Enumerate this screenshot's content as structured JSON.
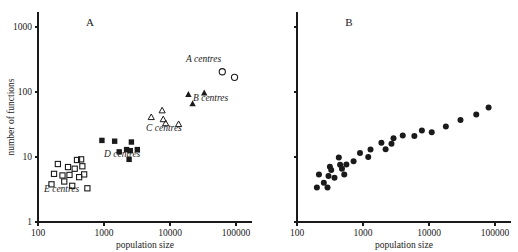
{
  "figure": {
    "background": "#ffffff",
    "ink": "#1a1a1a"
  },
  "chart_data": [
    {
      "type": "scatter",
      "panel": "A",
      "title": "A",
      "xlabel": "population size",
      "ylabel": "number of functions",
      "xscale": "log",
      "yscale": "log",
      "xlim": [
        100,
        316228
      ],
      "ylim": [
        1,
        3162
      ],
      "xticks": [
        100,
        1000,
        10000,
        100000
      ],
      "xticklabels": [
        "100",
        "1000",
        "10000",
        "100000"
      ],
      "yticks": [
        1,
        10,
        100,
        1000
      ],
      "yticklabels": [
        "1",
        "10",
        "100",
        "1000"
      ],
      "grid": false,
      "legend_position": "inline-annotations",
      "series": [
        {
          "name": "A centres",
          "marker": "open-circle",
          "label": "A centres",
          "points": [
            {
              "x": 62000,
              "y": 205
            },
            {
              "x": 95000,
              "y": 168
            }
          ]
        },
        {
          "name": "B centres",
          "marker": "filled-triangle",
          "label": "B centres",
          "points": [
            {
              "x": 19000,
              "y": 92
            },
            {
              "x": 22000,
              "y": 66
            },
            {
              "x": 33000,
              "y": 97
            }
          ]
        },
        {
          "name": "C centres",
          "marker": "open-triangle",
          "label": "C centres",
          "points": [
            {
              "x": 5200,
              "y": 41
            },
            {
              "x": 7600,
              "y": 52
            },
            {
              "x": 7900,
              "y": 38
            },
            {
              "x": 8600,
              "y": 33
            },
            {
              "x": 13500,
              "y": 32
            }
          ]
        },
        {
          "name": "D centres",
          "marker": "filled-square",
          "label": "D centres",
          "points": [
            {
              "x": 930,
              "y": 18
            },
            {
              "x": 1450,
              "y": 17.5
            },
            {
              "x": 1700,
              "y": 12
            },
            {
              "x": 2200,
              "y": 13
            },
            {
              "x": 2400,
              "y": 9.2
            },
            {
              "x": 2600,
              "y": 17
            },
            {
              "x": 3200,
              "y": 13
            },
            {
              "x": 2500,
              "y": 12.5
            }
          ]
        },
        {
          "name": "E centres",
          "marker": "open-square",
          "label": "E centres",
          "points": [
            {
              "x": 160,
              "y": 3.8
            },
            {
              "x": 175,
              "y": 5.5
            },
            {
              "x": 200,
              "y": 7.8
            },
            {
              "x": 235,
              "y": 5.2
            },
            {
              "x": 250,
              "y": 4.2
            },
            {
              "x": 285,
              "y": 7.0
            },
            {
              "x": 300,
              "y": 5.3
            },
            {
              "x": 330,
              "y": 3.6
            },
            {
              "x": 360,
              "y": 6.6
            },
            {
              "x": 390,
              "y": 9.0
            },
            {
              "x": 420,
              "y": 4.9
            },
            {
              "x": 450,
              "y": 9.2
            },
            {
              "x": 470,
              "y": 7.2
            },
            {
              "x": 500,
              "y": 5.4
            },
            {
              "x": 560,
              "y": 3.3
            }
          ]
        }
      ]
    },
    {
      "type": "scatter",
      "panel": "B",
      "title": "B",
      "xlabel": "population size",
      "ylabel": "",
      "xscale": "log",
      "yscale": "log",
      "xlim": [
        100,
        316228
      ],
      "ylim": [
        1,
        3162
      ],
      "xticks": [
        100,
        1000,
        10000,
        100000
      ],
      "xticklabels": [
        "100",
        "1000",
        "10000",
        "100000"
      ],
      "yticks": [
        1,
        10,
        100,
        1000
      ],
      "yticklabels": [
        "",
        "",
        "",
        ""
      ],
      "grid": false,
      "legend_position": "none",
      "series": [
        {
          "name": "all centres",
          "marker": "filled-circle",
          "label": "",
          "points": [
            {
              "x": 200,
              "y": 3.4
            },
            {
              "x": 215,
              "y": 5.4
            },
            {
              "x": 255,
              "y": 4.0
            },
            {
              "x": 290,
              "y": 3.4
            },
            {
              "x": 300,
              "y": 5.1
            },
            {
              "x": 315,
              "y": 7.1
            },
            {
              "x": 330,
              "y": 6.3
            },
            {
              "x": 370,
              "y": 4.8
            },
            {
              "x": 430,
              "y": 9.8
            },
            {
              "x": 450,
              "y": 7.6
            },
            {
              "x": 480,
              "y": 6.6
            },
            {
              "x": 520,
              "y": 5.4
            },
            {
              "x": 560,
              "y": 7.7
            },
            {
              "x": 720,
              "y": 8.6
            },
            {
              "x": 900,
              "y": 11.5
            },
            {
              "x": 1200,
              "y": 10.0
            },
            {
              "x": 1300,
              "y": 13.0
            },
            {
              "x": 1900,
              "y": 16.5
            },
            {
              "x": 2200,
              "y": 13.2
            },
            {
              "x": 2700,
              "y": 16.0
            },
            {
              "x": 2900,
              "y": 19.5
            },
            {
              "x": 4000,
              "y": 21.5
            },
            {
              "x": 6000,
              "y": 21.0
            },
            {
              "x": 7800,
              "y": 25.5
            },
            {
              "x": 11000,
              "y": 24.0
            },
            {
              "x": 18000,
              "y": 29.5
            },
            {
              "x": 30000,
              "y": 37.0
            },
            {
              "x": 52000,
              "y": 45.0
            },
            {
              "x": 80000,
              "y": 58.0
            }
          ]
        }
      ]
    }
  ]
}
